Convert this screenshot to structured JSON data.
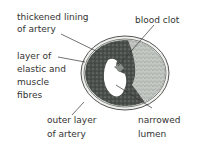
{
  "diagram": {
    "labels": [
      {
        "id": "thickened-lining",
        "text": "thickened lining\nof artery"
      },
      {
        "id": "blood-clot",
        "text": "blood clot"
      },
      {
        "id": "elastic-muscle",
        "text": "layer of\nelastic and\nmuscle\nfibres"
      },
      {
        "id": "outer-layer",
        "text": "outer layer\nof artery"
      },
      {
        "id": "narrowed-lumen",
        "text": "narrowed\nlumen"
      }
    ],
    "colors": {
      "outer_ring": "#e9ece8",
      "outline": "#555555",
      "dark_tissue": "#3a3f3b",
      "light_tissue": "#b8bcb6",
      "lumen": "#ffffff",
      "clot": "#8a8f8a"
    }
  }
}
